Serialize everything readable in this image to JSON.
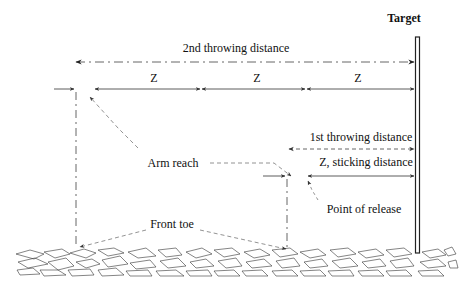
{
  "diagram": {
    "type": "throwing-distance-schematic",
    "labels": {
      "target": "Target",
      "second_throwing_distance": "2nd throwing distance",
      "z1": "Z",
      "z2": "Z",
      "z3": "Z",
      "first_throwing_distance": "1st throwing distance",
      "sticking_distance": "Z, sticking distance",
      "arm_reach": "Arm reach",
      "point_of_release": "Point of release",
      "front_toe": "Front toe"
    },
    "colors": {
      "line": "#222222",
      "dashed": "#555555",
      "ground": "#333333",
      "background": "#ffffff"
    },
    "segments": [
      {
        "name": "2nd throwing distance",
        "style": "dash-dot",
        "arrows": "both"
      },
      {
        "name": "Z",
        "count": 3,
        "style": "solid",
        "arrows": "both"
      },
      {
        "name": "1st throwing distance",
        "style": "dashed",
        "arrows": "both"
      },
      {
        "name": "Z, sticking distance",
        "style": "solid",
        "arrows": "both"
      }
    ]
  }
}
